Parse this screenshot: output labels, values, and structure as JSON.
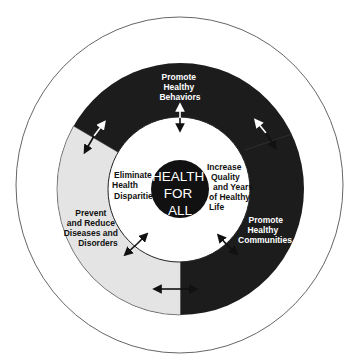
{
  "diagram": {
    "outer_arc_title": "Improve Systems for Personal and Public Health",
    "center": {
      "lines": [
        "HEALTH",
        "FOR",
        "ALL"
      ]
    },
    "segments": [
      {
        "name": "promote-healthy-behaviors",
        "lines": [
          "Promote",
          "Healthy",
          "Behaviors"
        ],
        "color": "#1c1c1c"
      },
      {
        "name": "promote-healthy-communities",
        "lines": [
          "Promote",
          "Healthy",
          "Communities"
        ],
        "color": "#1e1e1e"
      },
      {
        "name": "prevent-and-reduce-diseases",
        "lines": [
          "Prevent",
          "and Reduce",
          "Diseases and",
          "Disorders"
        ],
        "color": "#e4e4e4"
      }
    ],
    "inner_goals": [
      {
        "name": "eliminate-health-disparities",
        "lines": [
          "Eliminate",
          "Health",
          "Disparities"
        ]
      },
      {
        "name": "increase-quality-years",
        "lines": [
          "Increase",
          "Quality",
          "and Years",
          "of Healthy",
          "Life"
        ]
      }
    ],
    "colors": {
      "dark_segment": "#1c1c1c",
      "light_segment": "#e4e4e4",
      "outline": "#555555"
    }
  }
}
